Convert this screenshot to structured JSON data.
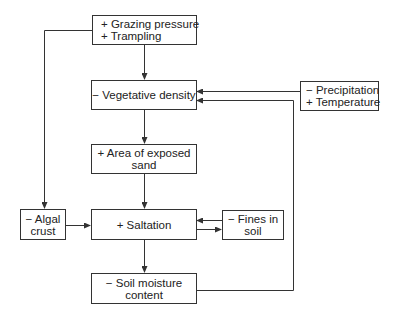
{
  "nodes": {
    "grazing": {
      "lines": [
        "+ Grazing pressure",
        "+ Trampling"
      ]
    },
    "vegetative": {
      "lines": [
        "− Vegetative density"
      ]
    },
    "climate": {
      "lines": [
        "− Precipitation",
        "+ Temperature"
      ]
    },
    "exposed_sand": {
      "lines": [
        "+ Area of exposed",
        "sand"
      ]
    },
    "algal": {
      "lines": [
        "− Algal",
        "crust"
      ]
    },
    "saltation": {
      "lines": [
        "+ Saltation"
      ]
    },
    "fines": {
      "lines": [
        "− Fines in",
        "soil"
      ]
    },
    "moisture": {
      "lines": [
        "− Soil moisture",
        "content"
      ]
    }
  },
  "edges": [
    {
      "from": "grazing",
      "to": "vegetative"
    },
    {
      "from": "grazing",
      "to": "algal"
    },
    {
      "from": "climate",
      "to": "vegetative"
    },
    {
      "from": "vegetative",
      "to": "exposed_sand"
    },
    {
      "from": "exposed_sand",
      "to": "saltation"
    },
    {
      "from": "algal",
      "to": "saltation"
    },
    {
      "from": "fines",
      "to": "saltation"
    },
    {
      "from": "saltation",
      "to": "fines"
    },
    {
      "from": "saltation",
      "to": "moisture"
    },
    {
      "from": "moisture",
      "to": "vegetative"
    }
  ],
  "colors": {
    "line": "#333333",
    "background": "#ffffff"
  }
}
